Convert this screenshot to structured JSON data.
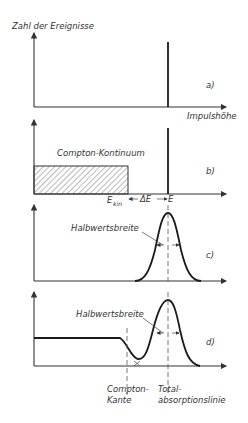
{
  "y_axis_label": "Zahl der Ereignisse",
  "x_axis_label": "Impulshöhe",
  "panels": {
    "a": {
      "tag": "a)"
    },
    "b": {
      "tag": "b)",
      "continuum_label": "Compton-Kontinuum",
      "e_kin": "E",
      "e_kin_sub": "kin",
      "delta_e": "ΔE",
      "e": "E"
    },
    "c": {
      "tag": "c)",
      "fwhm_label": "Halbwertsbreite"
    },
    "d": {
      "tag": "d)",
      "fwhm_label": "Halbwertsbreite",
      "compton_edge_line1": "Compton-",
      "compton_edge_line2": "Kante",
      "photopeak_line1": "Total-",
      "photopeak_line2": "absorptionslinie"
    }
  },
  "colors": {
    "ink": "#1a1a1a",
    "background": "#ffffff"
  }
}
